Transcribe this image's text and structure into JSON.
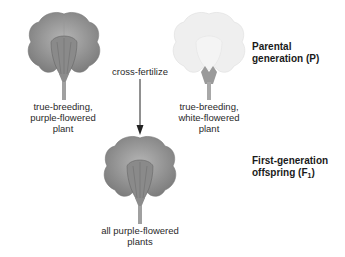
{
  "diagram": {
    "parental_label": "Parental generation (P)",
    "parental_line1": "Parental",
    "parental_line2": "generation (P)",
    "f1_line1": "First-generation",
    "f1_line2_prefix": "offspring (F",
    "f1_sub": "1",
    "f1_line2_suffix": ")",
    "cross_label": "cross-fertilize",
    "purple_parent": {
      "line1": "true-breeding,",
      "line2": "purple-flowered",
      "line3": "plant"
    },
    "white_parent": {
      "line1": "true-breeding,",
      "line2": "white-flowered",
      "line3": "plant"
    },
    "offspring": {
      "line1": "all purple-flowered",
      "line2": "plants"
    },
    "colors": {
      "purple_flower": "#8f8f8f",
      "purple_flower_dark": "#6e6e6e",
      "white_flower": "#ececec",
      "white_flower_edge": "#d8d8d8",
      "stem": "#9a9a9a",
      "arrow": "#222222"
    }
  }
}
